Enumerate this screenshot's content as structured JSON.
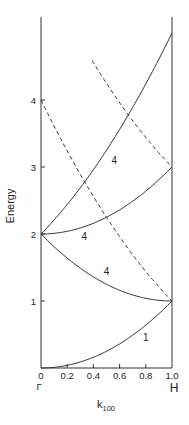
{
  "chart_data": {
    "type": "line",
    "title": "",
    "xlabel": "k",
    "xlabel_subscript": "100",
    "ylabel": "Energy",
    "xlim": [
      0,
      1.0
    ],
    "ylim": [
      0,
      5.24
    ],
    "grid": false,
    "legend": "none",
    "x_ticks": [
      {
        "value": 0,
        "label": "0"
      },
      {
        "value": 0.2,
        "label": "0.2"
      },
      {
        "value": 0.4,
        "label": "0.4"
      },
      {
        "value": 0.6,
        "label": "0.6"
      },
      {
        "value": 0.8,
        "label": "0.8"
      },
      {
        "value": 1.0,
        "label": "1.0"
      }
    ],
    "y_ticks": [
      {
        "value": 1,
        "label": "1"
      },
      {
        "value": 2,
        "label": "2"
      },
      {
        "value": 3,
        "label": "3"
      },
      {
        "value": 4,
        "label": "4"
      }
    ],
    "symmetry_points": [
      {
        "k": 0,
        "label": "Γ"
      },
      {
        "k": 1.0,
        "label": "H"
      }
    ],
    "series": [
      {
        "name": "band-1",
        "style": "solid",
        "degeneracy_label": "1",
        "x": [
          0,
          0.2,
          0.4,
          0.6,
          0.8,
          1.0
        ],
        "values": [
          0,
          0.04,
          0.16,
          0.36,
          0.64,
          1.0
        ],
        "label_at": [
          0.8,
          0.45
        ]
      },
      {
        "name": "band-2-to-1",
        "style": "solid",
        "degeneracy_label": "4",
        "x": [
          0,
          0.2,
          0.4,
          0.6,
          0.8,
          1.0
        ],
        "values": [
          2.0,
          1.64,
          1.36,
          1.16,
          1.04,
          1.0
        ],
        "label_at": [
          0.5,
          1.44
        ]
      },
      {
        "name": "band-2-to-3",
        "style": "solid",
        "degeneracy_label": "4",
        "x": [
          0,
          0.2,
          0.4,
          0.6,
          0.8,
          1.0
        ],
        "values": [
          2.0,
          2.04,
          2.16,
          2.36,
          2.64,
          3.0
        ],
        "label_at": [
          0.33,
          1.97
        ]
      },
      {
        "name": "band-2-to-5",
        "style": "solid",
        "degeneracy_label": "4",
        "x": [
          0,
          0.2,
          0.4,
          0.6,
          0.8,
          1.0
        ],
        "values": [
          2.0,
          2.44,
          2.96,
          3.56,
          4.24,
          5.0
        ],
        "label_at": [
          0.56,
          3.1
        ]
      },
      {
        "name": "dashed-4-to-1",
        "style": "dashed",
        "degeneracy_label": "",
        "x": [
          0,
          0.2,
          0.4,
          0.6,
          0.8,
          1.0
        ],
        "values": [
          4.0,
          3.24,
          2.56,
          1.96,
          1.44,
          1.0
        ]
      },
      {
        "name": "dashed-upper-to-3",
        "style": "dashed",
        "degeneracy_label": "",
        "x": [
          0.39,
          0.6,
          0.8,
          1.0
        ],
        "values": [
          4.59,
          3.96,
          3.44,
          3.0
        ]
      }
    ]
  },
  "labels": {
    "ylabel": "Energy",
    "xlabel_main": "k",
    "xlabel_sub": "100",
    "gamma": "Γ",
    "h_point": "H"
  }
}
